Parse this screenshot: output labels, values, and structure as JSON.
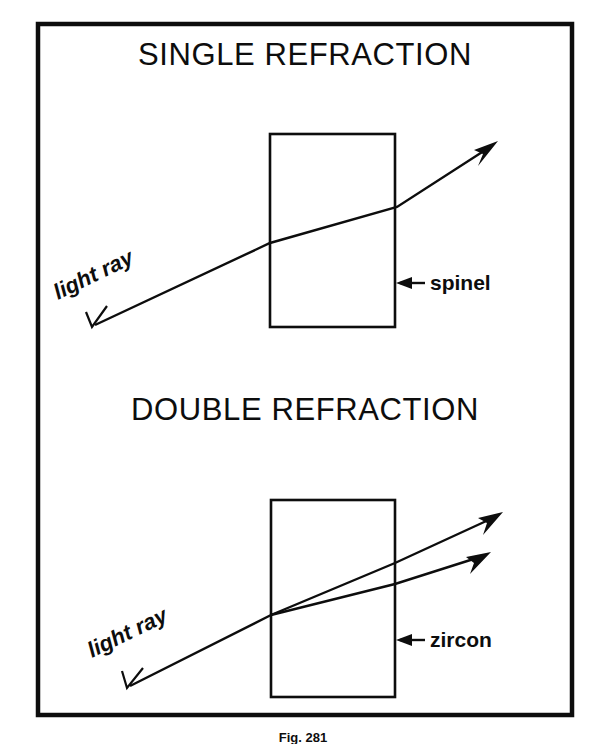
{
  "figure": {
    "caption": "Fig. 281",
    "frame": {
      "color": "#0d0d0d"
    },
    "panels": [
      {
        "id": "single-refraction",
        "title": "SINGLE REFRACTION",
        "title_x": 305,
        "title_y": 65,
        "crystal": {
          "x": 270,
          "y": 134,
          "width": 125,
          "height": 193
        },
        "material_label": "spinel",
        "material_label_x": 430,
        "material_label_y": 290,
        "leader": {
          "x1": 425,
          "y1": 283,
          "x2": 397,
          "y2": 283
        },
        "ray_label": "light ray",
        "ray_label_x": 58,
        "ray_label_y": 300,
        "ray_label_rotation": -26,
        "rays": [
          {
            "name": "incident-refracted-ray",
            "points": "95,325 270,243 397,207 490,147",
            "tail_arrow": "open",
            "head_arrow": "solid"
          }
        ]
      },
      {
        "id": "double-refraction",
        "title": "DOUBLE REFRACTION",
        "title_x": 305,
        "title_y": 420,
        "crystal": {
          "x": 271,
          "y": 500,
          "width": 124,
          "height": 197
        },
        "material_label": "zircon",
        "material_label_x": 430,
        "material_label_y": 647,
        "leader": {
          "x1": 425,
          "y1": 640,
          "x2": 397,
          "y2": 640
        },
        "ray_label": "light ray",
        "ray_label_x": 92,
        "ray_label_y": 658,
        "ray_label_rotation": -26,
        "rays": [
          {
            "name": "extraordinary-ray",
            "points": "130,686 271,615 395,563 495,517",
            "tail_arrow": "open",
            "head_arrow": "solid"
          },
          {
            "name": "ordinary-ray",
            "points": "271,615 395,584 483,556",
            "tail_arrow": "none",
            "head_arrow": "solid"
          }
        ]
      }
    ]
  }
}
